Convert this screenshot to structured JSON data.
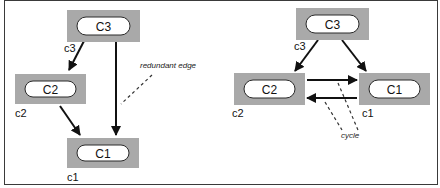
{
  "diagrams": [
    {
      "id": "left",
      "nodes": [
        {
          "id": "c3",
          "title": "C3",
          "label": "c3",
          "box": [
            67,
            10,
            73,
            32
          ],
          "label_pos": [
            64,
            52
          ]
        },
        {
          "id": "c2",
          "title": "C2",
          "label": "c2",
          "box": [
            15,
            74,
            71,
            30
          ],
          "label_pos": [
            15,
            117
          ]
        },
        {
          "id": "c1",
          "title": "C1",
          "label": "c1",
          "box": [
            67,
            138,
            72,
            30
          ],
          "label_pos": [
            67,
            181
          ]
        }
      ],
      "edges": [
        {
          "from": "c3",
          "to": "c2",
          "path": [
            84,
            41,
            69,
            70
          ]
        },
        {
          "from": "c2",
          "to": "c1",
          "path": [
            60,
            106,
            80,
            135
          ]
        },
        {
          "from": "c3",
          "to": "c1",
          "path": [
            116,
            41,
            116,
            135
          ],
          "name": "redundant"
        }
      ],
      "annotations": [
        {
          "text": "redundant edge",
          "pos": [
            140,
            68
          ],
          "leader": [
            152,
            75,
            121,
            104
          ]
        }
      ]
    },
    {
      "id": "right",
      "nodes": [
        {
          "id": "c3",
          "title": "C3",
          "label": "c3",
          "box": [
            296,
            8,
            73,
            32
          ],
          "label_pos": [
            294,
            50
          ]
        },
        {
          "id": "c2",
          "title": "C2",
          "label": "c2",
          "box": [
            234,
            73,
            71,
            32
          ],
          "label_pos": [
            232,
            117
          ]
        },
        {
          "id": "c1",
          "title": "C1",
          "label": "c1",
          "box": [
            359,
            73,
            71,
            32
          ],
          "label_pos": [
            362,
            117
          ]
        }
      ],
      "edges": [
        {
          "from": "c3",
          "to": "c2",
          "path": [
            318,
            40,
            295,
            71
          ]
        },
        {
          "from": "c3",
          "to": "c1",
          "path": [
            342,
            40,
            366,
            71
          ]
        },
        {
          "from": "c2",
          "to": "c1",
          "path": [
            307,
            80,
            357,
            80
          ]
        },
        {
          "from": "c1",
          "to": "c2",
          "path": [
            357,
            98,
            307,
            98
          ]
        }
      ],
      "annotations": [
        {
          "text": "cycle",
          "pos": [
            341,
            138
          ],
          "leaders": [
            [
              338,
              83,
              358,
              130
            ],
            [
              325,
              102,
              342,
              130
            ]
          ]
        }
      ]
    }
  ]
}
